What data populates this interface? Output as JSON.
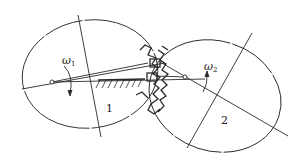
{
  "diagram": {
    "gear1": {
      "label": "1",
      "angular_velocity_symbol": "ω",
      "angular_velocity_subscript": "1"
    },
    "gear2": {
      "label": "2",
      "angular_velocity_symbol": "ω",
      "angular_velocity_subscript": "2"
    },
    "colors": {
      "stroke": "#2a2a2a",
      "background": "#ffffff"
    }
  }
}
